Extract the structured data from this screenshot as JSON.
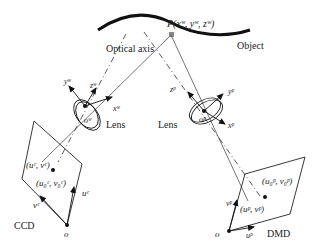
{
  "object": {
    "label": "Object",
    "point_label": "P(x",
    "point_sup": "w",
    "point_full": "P(xʷ, yʷ, zʷ)"
  },
  "optical_axis": {
    "label": "Optical axis"
  },
  "left_lens": {
    "label": "Lens",
    "origin": "oʷ",
    "axes": {
      "x": "xʷ",
      "y": "yʷ",
      "z": "zʷ"
    }
  },
  "right_lens": {
    "label": "Lens",
    "origin": "oᵖ",
    "axes": {
      "x": "xᵖ",
      "y": "yᵖ",
      "z": "zᵖ"
    }
  },
  "ccd": {
    "label": "CCD",
    "origin": "o",
    "u_axis": "uᶜ",
    "v_axis": "vᶜ",
    "image_point": "(uᶜ, vᶜ)",
    "principal_point": "(u₀ᶜ, v₀ᶜ)"
  },
  "dmd": {
    "label": "DMD",
    "origin": "o",
    "u_axis": "uᵖ",
    "v_axis": "vᵖ",
    "image_point": "(uᵖ, vᵖ)",
    "principal_point": "(u₀ᵖ, v₀ᵖ)"
  }
}
